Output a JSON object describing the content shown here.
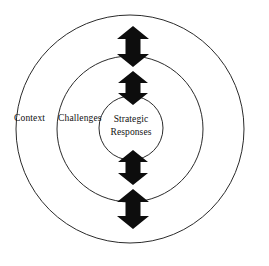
{
  "diagram": {
    "type": "concentric-circles",
    "background_color": "#ffffff",
    "ring_stroke_color": "#2b2b2b",
    "arrow_fill_color": "#0d0d0d",
    "text_color": "#111111",
    "rings": [
      {
        "id": "outer",
        "label": "Context",
        "label_x": 14,
        "label_y": 121,
        "cx": 130,
        "cy": 129,
        "r": 114
      },
      {
        "id": "middle",
        "label": "Challenges",
        "label_x": 58,
        "label_y": 121,
        "cx": 130,
        "cy": 129,
        "r": 73
      },
      {
        "id": "inner",
        "label": "Strategic Responses",
        "label_line_1": "Strategic",
        "label_line_2": "Responses",
        "label_x": 131,
        "label_y_line_1": 122,
        "label_y_line_2": 135,
        "cx": 131,
        "cy": 128,
        "r": 32
      }
    ],
    "arrows": [
      {
        "id": "arrow-outer-top",
        "direction": "double-vertical",
        "center_x": 133,
        "top": 26,
        "bottom": 67,
        "head_half_width": 16,
        "shaft_half_width": 7.5,
        "head_height": 13
      },
      {
        "id": "arrow-inner-top",
        "direction": "double-vertical",
        "center_x": 133,
        "top": 71,
        "bottom": 105,
        "head_half_width": 15,
        "shaft_half_width": 7.5,
        "head_height": 12
      },
      {
        "id": "arrow-inner-bottom",
        "direction": "double-vertical",
        "center_x": 133,
        "top": 150,
        "bottom": 185,
        "head_half_width": 15,
        "shaft_half_width": 7.5,
        "head_height": 12
      },
      {
        "id": "arrow-outer-bottom",
        "direction": "double-vertical",
        "center_x": 133,
        "top": 189,
        "bottom": 229,
        "head_half_width": 16,
        "shaft_half_width": 7.5,
        "head_height": 13
      }
    ]
  }
}
